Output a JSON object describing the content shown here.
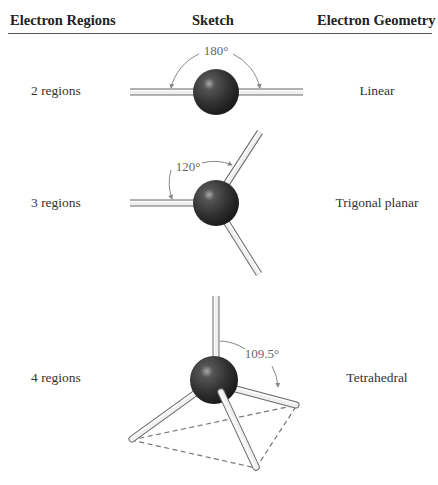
{
  "table": {
    "headers": {
      "regions": "Electron Regions",
      "sketch": "Sketch",
      "geometry": "Electron Geometry"
    },
    "rows": [
      {
        "regions": "2 regions",
        "angle": "180°",
        "geometry": "Linear"
      },
      {
        "regions": "3 regions",
        "angle": "120°",
        "geometry": "Trigonal planar"
      },
      {
        "regions": "4 regions",
        "angle": "109.5°",
        "geometry": "Tetrahedral"
      }
    ]
  },
  "colors": {
    "sphere": "#3a3a3a",
    "rod": "#e6e6e6",
    "rod_outline": "#6a6a6a",
    "angle_arc": "#888888",
    "dashed_base": "#777777"
  }
}
